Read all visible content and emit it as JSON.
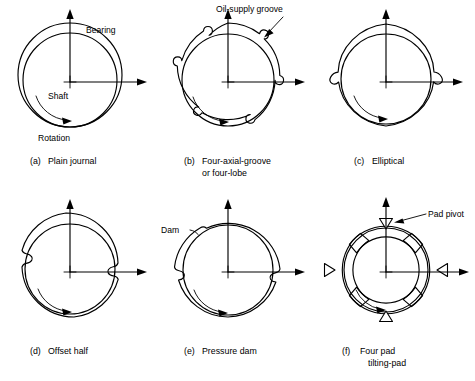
{
  "figure": {
    "background_color": "#ffffff",
    "line_color": "#000000",
    "rows": 2,
    "columns": 3
  },
  "panels": [
    {
      "key": "a",
      "caption_label": "(a)",
      "caption_line1": "Plain journal",
      "caption_line2": "",
      "annotations": [
        {
          "name": "bearing",
          "text": "Bearing"
        },
        {
          "name": "shaft",
          "text": "Shaft"
        },
        {
          "name": "rotation",
          "text": "Rotation"
        }
      ]
    },
    {
      "key": "b",
      "caption_label": "(b)",
      "caption_line1": "Four-axial-groove",
      "caption_line2": "or four-lobe",
      "annotations": [
        {
          "name": "oil-supply-groove",
          "text": "Oil-supply groove"
        }
      ]
    },
    {
      "key": "c",
      "caption_label": "(c)",
      "caption_line1": "Elliptical",
      "caption_line2": "",
      "annotations": []
    },
    {
      "key": "d",
      "caption_label": "(d)",
      "caption_line1": "Offset half",
      "caption_line2": "",
      "annotations": []
    },
    {
      "key": "e",
      "caption_label": "(e)",
      "caption_line1": "Pressure dam",
      "caption_line2": "",
      "annotations": [
        {
          "name": "dam",
          "text": "Dam"
        }
      ]
    },
    {
      "key": "f",
      "caption_label": "(f)",
      "caption_line1": "Four pad",
      "caption_line2": "tilting-pad",
      "annotations": [
        {
          "name": "pad-pivot",
          "text": "Pad pivot"
        }
      ]
    }
  ],
  "labels": {
    "bearing": "Bearing",
    "shaft": "Shaft",
    "rotation": "Rotation",
    "oil_supply_groove": "Oil-supply groove",
    "dam": "Dam",
    "pad_pivot": "Pad pivot"
  },
  "captions": {
    "a_label": "(a)",
    "a_text": "Plain journal",
    "b_label": "(b)",
    "b_text1": "Four-axial-groove",
    "b_text2": "or four-lobe",
    "c_label": "(c)",
    "c_text": "Elliptical",
    "d_label": "(d)",
    "d_text": "Offset half",
    "e_label": "(e)",
    "e_text": "Pressure dam",
    "f_label": "(f)",
    "f_text1": "Four pad",
    "f_text2": "tilting-pad"
  }
}
